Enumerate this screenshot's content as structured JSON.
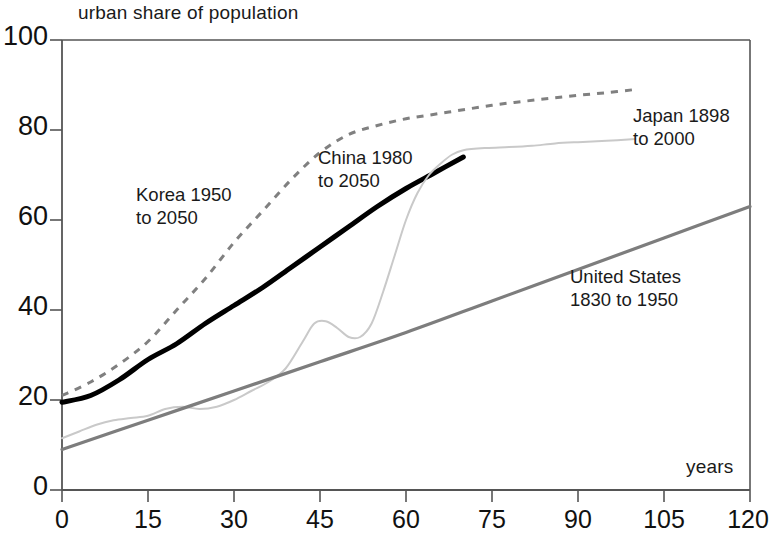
{
  "chart_data": {
    "type": "line",
    "title": "urban share of population",
    "xlabel": "years",
    "ylabel": "urban share of population",
    "xlim": [
      0,
      120
    ],
    "ylim": [
      0,
      100
    ],
    "xticks": [
      "0",
      "15",
      "30",
      "45",
      "60",
      "75",
      "90",
      "105",
      "120"
    ],
    "yticks": [
      "0",
      "20",
      "40",
      "60",
      "80",
      "100"
    ],
    "grid": false,
    "legend": "inline-annotations",
    "series": [
      {
        "name": "Korea 1950 to 2050",
        "label": "Korea 1950\nto 2050",
        "style": "dashed",
        "color": "#808080",
        "x": [
          0,
          5,
          10,
          15,
          20,
          25,
          30,
          35,
          40,
          45,
          50,
          55,
          60,
          65,
          70,
          75,
          80,
          85,
          90,
          95,
          100
        ],
        "y": [
          21,
          24,
          28,
          33,
          40,
          47,
          55,
          62,
          69,
          75,
          79,
          81,
          82.5,
          83.5,
          84.5,
          85.5,
          86.3,
          87,
          87.7,
          88.3,
          89
        ]
      },
      {
        "name": "China 1980 to 2050",
        "label": "China 1980\nto 2050",
        "style": "solid-thick",
        "color": "#000000",
        "x": [
          0,
          5,
          10,
          15,
          20,
          25,
          30,
          35,
          40,
          45,
          50,
          55,
          60,
          65,
          70
        ],
        "y": [
          19.5,
          21,
          24.5,
          29,
          32.5,
          37,
          41,
          45,
          49.5,
          54,
          58.5,
          63,
          67,
          70.5,
          74
        ]
      },
      {
        "name": "Japan 1898 to 2000",
        "label": "Japan 1898\nto 2000",
        "style": "solid-thin",
        "color": "#c9c9c9",
        "x": [
          0,
          3,
          6,
          9,
          12,
          15,
          18,
          21,
          24,
          27,
          30,
          33,
          36,
          39,
          42,
          44,
          46,
          48,
          50,
          52,
          54,
          56,
          58,
          60,
          62,
          64,
          66,
          68,
          70,
          74,
          78,
          82,
          86,
          90,
          95,
          100
        ],
        "y": [
          11.5,
          13,
          14.5,
          15.5,
          16,
          16.5,
          18,
          18.5,
          18,
          18.5,
          20,
          22,
          24,
          27,
          33,
          37,
          37.5,
          36,
          34,
          34,
          37,
          44,
          52,
          60,
          66,
          70,
          72.5,
          74.5,
          75.5,
          76,
          76.2,
          76.5,
          77,
          77.3,
          77.6,
          78
        ]
      },
      {
        "name": "United States 1830 to 1950",
        "label": "United States\n1830 to 1950",
        "style": "solid-medium",
        "color": "#7d7d7d",
        "x": [
          0,
          15,
          30,
          45,
          60,
          75,
          90,
          105,
          120
        ],
        "y": [
          9,
          15.5,
          22,
          28.5,
          35,
          42,
          49,
          56,
          63
        ]
      }
    ]
  },
  "axes": {
    "y_title": "urban share of population",
    "x_title": "years",
    "y_ticks": [
      "100",
      "80",
      "60",
      "40",
      "20",
      "0"
    ],
    "x_ticks": [
      "0",
      "15",
      "30",
      "45",
      "60",
      "75",
      "90",
      "105",
      "120"
    ]
  },
  "annotations": {
    "korea_line1": "Korea 1950",
    "korea_line2": "to 2050",
    "china_line1": "China 1980",
    "china_line2": "to 2050",
    "japan_line1": "Japan 1898",
    "japan_line2": "to 2000",
    "us_line1": "United States",
    "us_line2": "1830 to 1950"
  },
  "colors": {
    "korea": "#808080",
    "china": "#000000",
    "japan": "#c9c9c9",
    "united_states": "#7d7d7d",
    "axis": "#555555",
    "text": "#1a1a1a"
  }
}
